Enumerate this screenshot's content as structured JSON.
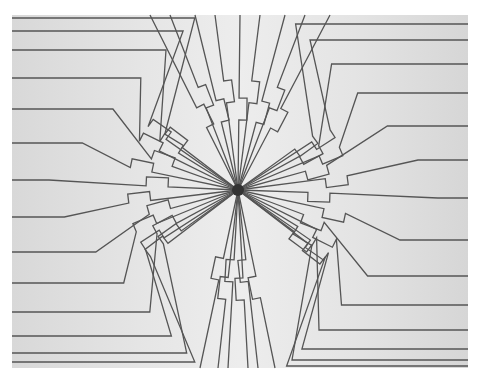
{
  "image": {
    "description": "Micrograph of radial fan-out conductor traces converging to a central point",
    "colors": {
      "background": "#ffffff",
      "plate": "#e4e4e4",
      "trace": "#555555",
      "hub": "#333333"
    },
    "center": [
      238,
      190
    ],
    "traces_per_side": 16
  }
}
